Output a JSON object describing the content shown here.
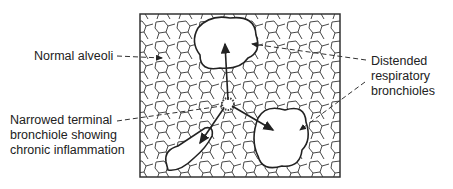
{
  "diagram": {
    "type": "anatomical illustration",
    "labels": {
      "normal_alveoli": "Normal alveoli",
      "narrowed_bronchiole": [
        "Narrowed terminal",
        "bronchiole showing",
        "chronic inflammation"
      ],
      "distended_bronchioles": [
        "Distended",
        "respiratory",
        "bronchioles"
      ]
    },
    "colors": {
      "ink": "#222222",
      "background": "#ffffff"
    }
  }
}
